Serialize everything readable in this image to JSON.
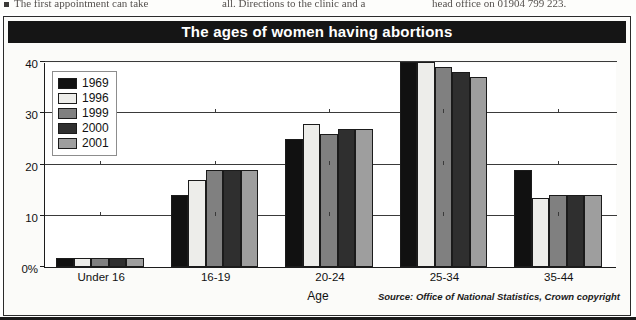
{
  "newsprint": {
    "column_1": "The first appointment can take",
    "column_2": "all. Directions to the clinic and a",
    "column_3": "head office on 01904 799 223."
  },
  "figure": {
    "title": "The ages of women having abortions",
    "source": "Source: Office of National Statistics, Crown copyright"
  },
  "colors": {
    "title_bar": "#151515",
    "frame": "#2b2b2b",
    "series_1969": "#111111",
    "series_1996": "#ededea",
    "series_1999": "#808080",
    "series_2000": "#2f2f2f",
    "series_2001": "#9e9e9e"
  },
  "chart_data": {
    "type": "bar",
    "title": "The ages of women having abortions",
    "xlabel": "Age",
    "ylabel": "",
    "ylim": [
      0,
      40
    ],
    "ytick_labels": [
      "0%",
      "10",
      "20",
      "30",
      "40"
    ],
    "ytick_values": [
      0,
      10,
      20,
      30,
      40
    ],
    "grid": true,
    "legend_position": "top-left-inside",
    "categories": [
      "Under 16",
      "16-19",
      "20-24",
      "25-34",
      "35-44"
    ],
    "series": [
      {
        "name": "1969",
        "color": "#111111",
        "values": [
          1.7,
          14,
          25,
          40,
          19
        ]
      },
      {
        "name": "1996",
        "color": "#ededea",
        "values": [
          1.7,
          17,
          28,
          40,
          13.5
        ]
      },
      {
        "name": "1999",
        "color": "#808080",
        "values": [
          1.7,
          19,
          26,
          39,
          14
        ]
      },
      {
        "name": "2000",
        "color": "#2f2f2f",
        "values": [
          1.7,
          19,
          27,
          38,
          14
        ]
      },
      {
        "name": "2001",
        "color": "#9e9e9e",
        "values": [
          1.7,
          19,
          27,
          37,
          14
        ]
      }
    ],
    "annotations": [
      "Source: Office of National Statistics, Crown copyright"
    ]
  }
}
